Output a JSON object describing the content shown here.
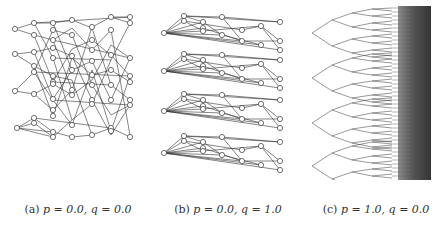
{
  "figure": {
    "panels": [
      {
        "id": "a",
        "label": "(a)",
        "params": "p = 0.0, q = 0.0",
        "p": "0.0",
        "q": "0.0"
      },
      {
        "id": "b",
        "label": "(b)",
        "params": "p = 0.0, q = 1.0",
        "p": "0.0",
        "q": "1.0"
      },
      {
        "id": "c",
        "label": "(c)",
        "params": "p = 1.0, q = 0.0",
        "p": "1.0",
        "q": "0.0"
      }
    ],
    "colors": {
      "edge": "#333333",
      "node_fill": "#ffffff",
      "node_stroke": "#333333",
      "background": "#ffffff"
    }
  }
}
